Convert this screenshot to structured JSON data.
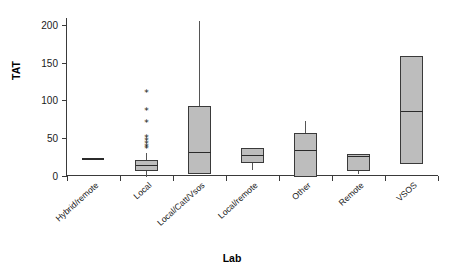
{
  "chart_data": {
    "type": "box",
    "title": "",
    "xlabel": "Lab",
    "ylabel": "TAT",
    "ylim": [
      0,
      215
    ],
    "yticks": [
      0,
      50,
      100,
      150,
      200
    ],
    "ytick_labels": [
      "0",
      "50",
      "100",
      "150",
      "200"
    ],
    "grid": false,
    "legend": "none",
    "categories": [
      "Hybrid/remote",
      "Local",
      "Local/Catt/Vsos",
      "Local/remote",
      "Other",
      "Remote",
      "VSOS"
    ],
    "boxes": [
      {
        "category": "Hybrid/remote",
        "q1": 23,
        "median": 23,
        "q3": 23,
        "whisker_low": 23,
        "whisker_high": 23,
        "outliers": [],
        "degenerate": true
      },
      {
        "category": "Local",
        "q1": 7,
        "median": 14,
        "q3": 21,
        "whisker_low": 0,
        "whisker_high": 31,
        "outliers": [
          110,
          87,
          71,
          51,
          46,
          42,
          38,
          36
        ],
        "degenerate": false
      },
      {
        "category": "Local/Catt/Vsos",
        "q1": 3,
        "median": 31,
        "q3": 93,
        "whisker_low": 3,
        "whisker_high": 206,
        "outliers": [],
        "degenerate": false
      },
      {
        "category": "Local/remote",
        "q1": 18,
        "median": 27,
        "q3": 37,
        "whisker_low": 9,
        "whisker_high": 37,
        "outliers": [],
        "degenerate": false
      },
      {
        "category": "Other",
        "q1": 0,
        "median": 34,
        "q3": 56,
        "whisker_low": 0,
        "whisker_high": 74,
        "outliers": [],
        "degenerate": false
      },
      {
        "category": "Remote",
        "q1": 7,
        "median": 26,
        "q3": 29,
        "whisker_low": 3,
        "whisker_high": 29,
        "outliers": [],
        "degenerate": false
      },
      {
        "category": "VSOS",
        "q1": 16,
        "median": 86,
        "q3": 159,
        "whisker_low": 16,
        "whisker_high": 159,
        "outliers": [],
        "degenerate": false
      }
    ],
    "colors": {
      "box_fill": "#bdbdbd",
      "box_stroke": "#3a3a3a",
      "median": "#2b2b2b",
      "axis": "#3a3a3a",
      "text": "#1a1a1a",
      "background": "#ffffff"
    },
    "outlier_marker": "*"
  }
}
